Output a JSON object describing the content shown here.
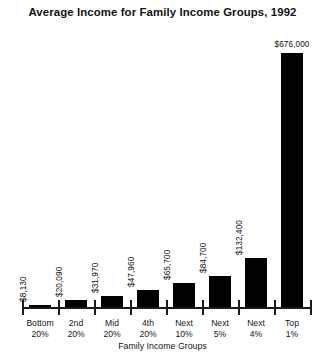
{
  "chart_data": {
    "type": "bar",
    "title": "Average Income for Family Income Groups, 1992",
    "xlabel": "Family Income Groups",
    "ylabel": "",
    "ylim": [
      0,
      676000
    ],
    "grid": false,
    "legend": "none",
    "bar_color": "#000000",
    "categories": [
      "Bottom 20%",
      "2nd 20%",
      "Mid 20%",
      "4th 20%",
      "Next 10%",
      "Next 5%",
      "Next 4%",
      "Top 1%"
    ],
    "category_lines": [
      {
        "line1": "Bottom",
        "line2": "20%"
      },
      {
        "line1": "2nd",
        "line2": "20%"
      },
      {
        "line1": "Mid",
        "line2": "20%"
      },
      {
        "line1": "4th",
        "line2": "20%"
      },
      {
        "line1": "Next",
        "line2": "10%"
      },
      {
        "line1": "Next",
        "line2": "5%"
      },
      {
        "line1": "Next",
        "line2": "4%"
      },
      {
        "line1": "Top",
        "line2": "1%"
      }
    ],
    "values": [
      8130,
      20090,
      31970,
      47960,
      65700,
      84700,
      132400,
      676000
    ],
    "value_labels": [
      "$8,130",
      "$20,090",
      "$31,970",
      "$47,960",
      "$65,700",
      "$84,700",
      "$132,400",
      "$676,000"
    ]
  }
}
